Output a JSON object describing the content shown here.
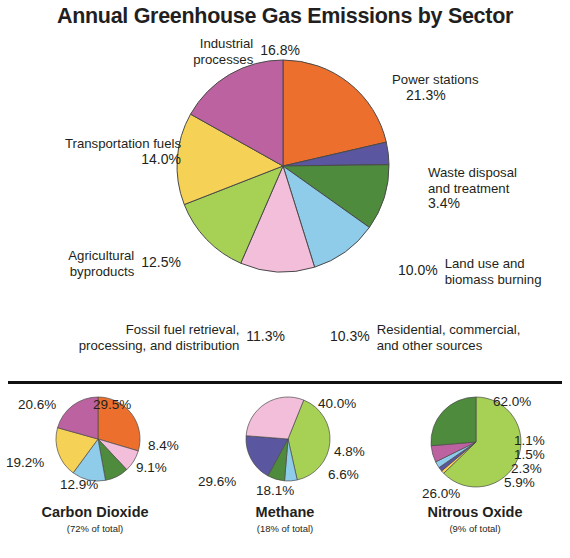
{
  "title": "Annual Greenhouse Gas Emissions by Sector",
  "chart_data": [
    {
      "type": "pie",
      "name": "main",
      "title": "Annual Greenhouse Gas Emissions by Sector",
      "categories": [
        "Power stations",
        "Waste disposal and treatment",
        "Land use and biomass burning",
        "Residential, commercial, and other sources",
        "Fossil fuel retrieval, processing, and distribution",
        "Agricultural byproducts",
        "Transportation fuels",
        "Industrial processes"
      ],
      "values": [
        21.3,
        3.4,
        10.0,
        10.3,
        11.3,
        12.5,
        14.0,
        16.8
      ],
      "labels": [
        "21.3%",
        "3.4%",
        "10.0%",
        "10.3%",
        "11.3%",
        "12.5%",
        "14.0%",
        "16.8%"
      ],
      "colors": [
        "#ED6F2E",
        "#5B56A0",
        "#4E8B3C",
        "#8FCCEA",
        "#F2BEDA",
        "#A6D155",
        "#F5D155",
        "#BD62A0"
      ],
      "unit": "percent"
    },
    {
      "type": "pie",
      "name": "carbon-dioxide",
      "title": "Carbon Dioxide",
      "subtitle": "(72% of total)",
      "values": [
        29.5,
        8.4,
        9.1,
        12.9,
        19.2,
        20.6
      ],
      "labels": [
        "29.5%",
        "8.4%",
        "9.1%",
        "12.9%",
        "19.2%",
        "20.6%"
      ],
      "colors": [
        "#ED6F2E",
        "#F2BEDA",
        "#4E8B3C",
        "#8FCCEA",
        "#F5D155",
        "#BD62A0"
      ],
      "unit": "percent"
    },
    {
      "type": "pie",
      "name": "methane",
      "title": "Methane",
      "subtitle": "(18% of total)",
      "values": [
        40.0,
        4.8,
        6.6,
        18.1,
        29.6
      ],
      "labels": [
        "40.0%",
        "4.8%",
        "6.6%",
        "18.1%",
        "29.6%"
      ],
      "colors": [
        "#A6D155",
        "#8FCCEA",
        "#4E8B3C",
        "#5B56A0",
        "#F2BEDA"
      ],
      "unit": "percent"
    },
    {
      "type": "pie",
      "name": "nitrous-oxide",
      "title": "Nitrous Oxide",
      "subtitle": "(9% of total)",
      "values": [
        62.0,
        1.1,
        1.5,
        2.3,
        5.9,
        26.0
      ],
      "labels": [
        "62.0%",
        "1.1%",
        "1.5%",
        "2.3%",
        "5.9%",
        "26.0%"
      ],
      "colors": [
        "#A6D155",
        "#F5D155",
        "#5B56A0",
        "#8FCCEA",
        "#BD62A0",
        "#4E8B3C"
      ],
      "unit": "percent"
    }
  ],
  "main_chart": {
    "segments": {
      "power": {
        "name": "Power stations",
        "pct": "21.3%"
      },
      "waste": {
        "line1": "Waste disposal",
        "line2": "and treatment",
        "pct": "3.4%"
      },
      "landuse": {
        "line1": "Land use and",
        "line2": "biomass burning",
        "pct": "10.0%"
      },
      "residential": {
        "line1": "Residential, commercial,",
        "line2": "and other sources",
        "pct": "10.3%"
      },
      "fossil": {
        "line1": "Fossil fuel retrieval,",
        "line2": "processing, and distribution",
        "pct": "11.3%"
      },
      "agricultural": {
        "line1": "Agricultural",
        "line2": "byproducts",
        "pct": "12.5%"
      },
      "transportation": {
        "line1": "Transportation fuels",
        "pct": "14.0%"
      },
      "industrial": {
        "line1": "Industrial",
        "line2": "processes",
        "pct": "16.8%"
      }
    }
  },
  "small_charts": {
    "co2": {
      "title": "Carbon Dioxide",
      "subtitle": "(72% of total)",
      "labels": {
        "a": "29.5%",
        "b": "8.4%",
        "c": "9.1%",
        "d": "12.9%",
        "e": "19.2%",
        "f": "20.6%"
      }
    },
    "ch4": {
      "title": "Methane",
      "subtitle": "(18% of total)",
      "labels": {
        "a": "40.0%",
        "b": "4.8%",
        "c": "6.6%",
        "d": "18.1%",
        "e": "29.6%"
      }
    },
    "n2o": {
      "title": "Nitrous Oxide",
      "subtitle": "(9% of total)",
      "labels": {
        "a": "62.0%",
        "b": "1.1%",
        "c": "1.5%",
        "d": "2.3%",
        "e": "5.9%",
        "f": "26.0%"
      }
    }
  }
}
